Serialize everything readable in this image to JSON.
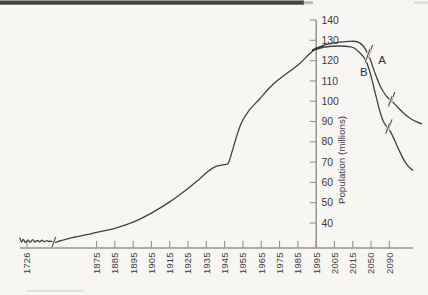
{
  "chart_data": {
    "type": "line",
    "title": "",
    "ylabel": "Population (millions)",
    "xlabel": "",
    "x_tick_labels": [
      "1726",
      "1875",
      "1885",
      "1895",
      "1905",
      "1915",
      "1925",
      "1935",
      "1945",
      "1955",
      "1965",
      "1975",
      "1985",
      "1995",
      "2005",
      "2015",
      "2050",
      "2090"
    ],
    "y_ticks": [
      40,
      50,
      60,
      70,
      80,
      90,
      100,
      110,
      120,
      130,
      140
    ],
    "ylim": [
      28,
      140
    ],
    "x_axis_break_between": [
      "1726",
      "1875"
    ],
    "grid": false,
    "legend": "none",
    "series": [
      {
        "name": "historical",
        "points": [
          [
            1711,
            32.5
          ],
          [
            1714,
            30.6
          ],
          [
            1718,
            31.9
          ],
          [
            1723,
            30.4
          ],
          [
            1728,
            31.7
          ],
          [
            1733,
            30.5
          ],
          [
            1738,
            31.8
          ],
          [
            1743,
            30.6
          ],
          [
            1748,
            31.5
          ],
          [
            1753,
            30.7
          ],
          [
            1758,
            31.6
          ],
          [
            1763,
            30.8
          ],
          [
            1768,
            31.3
          ],
          [
            1773,
            30.9
          ],
          [
            1779,
            31.0
          ],
          [
            1786,
            30.4
          ],
          [
            1800,
            31.4
          ],
          [
            1815,
            32.3
          ],
          [
            1830,
            33.1
          ],
          [
            1845,
            33.8
          ],
          [
            1860,
            34.5
          ],
          [
            1875,
            35.4
          ],
          [
            1885,
            37.4
          ],
          [
            1895,
            40.4
          ],
          [
            1905,
            44.9
          ],
          [
            1915,
            50.4
          ],
          [
            1925,
            57
          ],
          [
            1931,
            61.5
          ],
          [
            1936,
            65.5
          ],
          [
            1940,
            67.8
          ],
          [
            1944,
            68.6
          ],
          [
            1947,
            69.5
          ],
          [
            1949,
            75
          ],
          [
            1951,
            81
          ],
          [
            1954,
            89
          ],
          [
            1958,
            95
          ],
          [
            1964,
            101
          ],
          [
            1970,
            107
          ],
          [
            1975,
            111
          ],
          [
            1981,
            115
          ],
          [
            1986,
            118.5
          ],
          [
            1991,
            123
          ],
          [
            1995,
            126
          ],
          [
            1999,
            127.3
          ]
        ]
      },
      {
        "name": "projection-A",
        "annotation": "A",
        "points": [
          [
            1993,
            125.3
          ],
          [
            2000,
            127.8
          ],
          [
            2007,
            129
          ],
          [
            2014,
            129.5
          ],
          [
            2021,
            129.4
          ],
          [
            2028,
            128.7
          ],
          [
            2035,
            127.2
          ],
          [
            2041,
            124.8
          ],
          [
            2047,
            121.5
          ],
          [
            2053,
            117.5
          ],
          [
            2060,
            113
          ],
          [
            2068,
            108.5
          ],
          [
            2076,
            105
          ],
          [
            2086,
            101.8
          ],
          [
            2096,
            100
          ],
          [
            2108,
            97
          ],
          [
            2122,
            94
          ],
          [
            2136,
            91.5
          ],
          [
            2150,
            89.8
          ],
          [
            2160,
            89
          ]
        ]
      },
      {
        "name": "projection-B",
        "annotation": "B",
        "points": [
          [
            1993,
            125
          ],
          [
            2000,
            126.7
          ],
          [
            2007,
            127.2
          ],
          [
            2014,
            126.8
          ],
          [
            2021,
            125.6
          ],
          [
            2028,
            124
          ],
          [
            2034,
            122.3
          ],
          [
            2040,
            120
          ],
          [
            2046,
            116
          ],
          [
            2051,
            111.5
          ],
          [
            2057,
            106
          ],
          [
            2063,
            100.5
          ],
          [
            2070,
            94.5
          ],
          [
            2077,
            90
          ],
          [
            2085,
            87.2
          ],
          [
            2093,
            84.8
          ],
          [
            2102,
            80.5
          ],
          [
            2112,
            75.5
          ],
          [
            2122,
            71
          ],
          [
            2132,
            67.8
          ],
          [
            2141,
            66
          ]
        ]
      }
    ],
    "annotations": [
      {
        "text": "A",
        "year": 2074,
        "value": 118.5
      },
      {
        "text": "B",
        "year": 2036,
        "value": 112.5
      }
    ],
    "break_marks": [
      {
        "on": "curves",
        "year": 2046,
        "value": 123.5,
        "style": "double",
        "len": 14
      },
      {
        "on": "projection-A",
        "year": 2095,
        "value": 101,
        "style": "double",
        "len": 11
      },
      {
        "on": "projection-B",
        "year": 2089,
        "value": 87.5,
        "style": "double",
        "len": 11
      },
      {
        "on": "x-axis",
        "year": 1783,
        "value": 30.3,
        "style": "single",
        "len": 12
      }
    ],
    "colors": {
      "curve": "#343434",
      "axis": "#949494",
      "text": "#3c3c3c",
      "background": "#f7f6f3",
      "scan_band": "#333333"
    }
  }
}
